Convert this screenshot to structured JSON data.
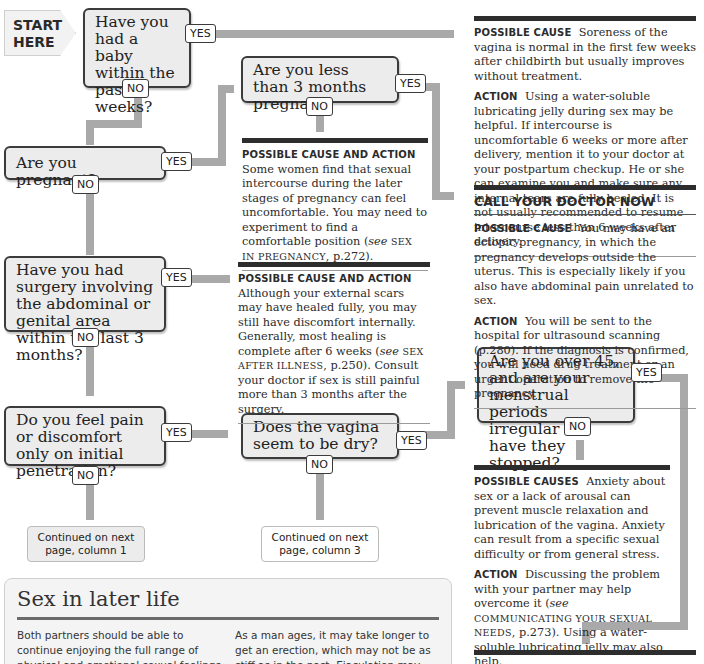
{
  "start": {
    "line1": "START",
    "line2": "HERE"
  },
  "labels": {
    "yes": "YES",
    "no": "NO"
  },
  "questions": [
    {
      "id": "baby",
      "text": "Have you had a baby within the past 6 weeks?"
    },
    {
      "id": "less3",
      "text": "Are you less than 3 months pregnant?"
    },
    {
      "id": "pregnant",
      "text": "Are you pregnant?"
    },
    {
      "id": "surgery",
      "text": "Have you had surgery involving the abdominal or genital area within the last 3 months?"
    },
    {
      "id": "pain",
      "text": "Do you feel pain or discomfort only on initial penetration?"
    },
    {
      "id": "dry",
      "text": "Does the vagina seem to be dry?"
    },
    {
      "id": "over45",
      "text": "Are you over 45, and are your menstrual periods irregular or have they stopped?"
    }
  ],
  "answers": {
    "postpartum": {
      "cause_label": "Possible cause",
      "cause_text": "Soreness of the vagina is normal in the first few weeks after childbirth but usually improves without treatment.",
      "action_label": "Action",
      "action_text": "Using a water-soluble lubricating jelly during sex may be helpful. If intercourse is uncomfortable 6 weeks or more after delivery, mention it to your doctor at your postpartum checkup. He or she can examine you and make sure any internal tears are fully healed. It is not usually recommended to resume intercourse less than 6 weeks after delivery."
    },
    "ectopic": {
      "alert": "CALL YOUR DOCTOR NOW",
      "cause_label": "Possible cause",
      "cause_text": "You may have an ectopic pregnancy, in which the pregnancy develops outside the uterus. This is especially likely if you also have abdominal pain unrelated to sex.",
      "action_label": "Action",
      "action_text": "You will be sent to the hospital for ultrasound scanning (p.280). If the diagnosis is confirmed, you will need drug treatment or an urgent operation to remove the pregnancy."
    },
    "late_pregnancy": {
      "label": "Possible cause and action",
      "text_a": "Some women find that sexual intercourse during the later stages of pregnancy can feel uncomfortable. You may need to experiment to find a comfortable position (",
      "see": "see",
      "ref": "Sex in pregnancy",
      "text_b": ", p.272)."
    },
    "surgery": {
      "label": "Possible cause and action",
      "text_a": "Although your external scars may have healed fully, you may still have discomfort internally. Generally, most healing is complete after 6 weeks (",
      "see": "see",
      "ref": "Sex after illness",
      "text_b": ", p.250). Consult your doctor if sex is still painful more than 3 months after the surgery."
    },
    "anxiety": {
      "cause_label": "Possible causes",
      "cause_text": "Anxiety about sex or a lack of arousal can prevent muscle relaxation and lubrication of the vagina. Anxiety can result from a specific sexual difficulty or from general stress.",
      "action_label": "Action",
      "action_text_a": "Discussing the problem with your partner may help overcome it (",
      "see": "see",
      "ref": "Communicating your sexual needs",
      "action_text_b": ", p.273). Using a water-soluble lubricating jelly may also help."
    }
  },
  "continuations": [
    {
      "id": "col1",
      "text": "Continued on next page, column 1"
    },
    {
      "id": "col3",
      "text": "Continued on next page, column 3"
    }
  ],
  "panel": {
    "title": "Sex in later life",
    "col1": "Both partners should be able to continue enjoying the full range of physical and emotional sexual feelings despite increasing age.",
    "col2": "As a man ages, it may take longer to get an erection, which may not be as stiff as in the past. Ejaculation may also be slightly delayed."
  },
  "colors": {
    "pipe": "#a9a9a9",
    "box_fill": "#ececec",
    "box_border": "#3b3b3b",
    "bar": "#2d2d2d"
  }
}
